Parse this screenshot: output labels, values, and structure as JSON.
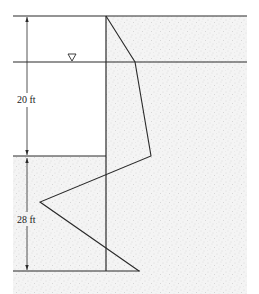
{
  "diagram": {
    "type": "sheet-pile-net-pressure-diagram",
    "labels": {
      "upper_dimension": "20 ft",
      "lower_dimension": "28 ft"
    },
    "symbols": {
      "water_table": "inverted-triangle"
    },
    "colors": {
      "line": "#2a2a2a",
      "soil_fill": "#f2f2f2",
      "soil_speckle": "#c8c8c8",
      "background": "#ffffff"
    }
  }
}
